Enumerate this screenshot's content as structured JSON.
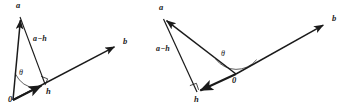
{
  "figure": {
    "stroke_color": "#1a1a1a",
    "background_color": "#ffffff",
    "panel_count": 2
  },
  "panels": [
    {
      "id": "acute-case",
      "name": "acute-angle-projection",
      "angle_type": "acute",
      "labels": {
        "vector_a": "a",
        "vector_b": "b",
        "vector_h": "h",
        "difference": "a−h",
        "angle": "θ",
        "origin": "0"
      },
      "points": {
        "origin": [
          13,
          100
        ],
        "a_tip": [
          20,
          16
        ],
        "b_tip": [
          118,
          45
        ],
        "h_tip": [
          45,
          84
        ]
      },
      "right_angle_at": "h",
      "label_positions": {
        "vector_a": [
          16,
          2
        ],
        "vector_b": [
          123,
          38
        ],
        "vector_h": [
          46,
          88
        ],
        "difference": [
          33,
          35
        ],
        "angle": [
          20,
          70
        ],
        "origin": [
          8,
          95
        ]
      }
    },
    {
      "id": "obtuse-case",
      "name": "obtuse-angle-projection",
      "angle_type": "obtuse",
      "labels": {
        "vector_a": "a",
        "vector_b": "b",
        "vector_h": "h",
        "difference": "a−h",
        "angle": "θ",
        "origin": "0"
      },
      "points": {
        "origin": [
          236,
          74
        ],
        "a_tip": [
          163,
          18
        ],
        "b_tip": [
          327,
          23
        ],
        "h_tip": [
          197,
          92
        ]
      },
      "right_angle_at": "h",
      "label_positions": {
        "vector_a": [
          159,
          4
        ],
        "vector_b": [
          332,
          15
        ],
        "vector_h": [
          195,
          96
        ],
        "difference": [
          157,
          45
        ],
        "angle": [
          222,
          52
        ],
        "origin": [
          233,
          78
        ]
      }
    }
  ]
}
